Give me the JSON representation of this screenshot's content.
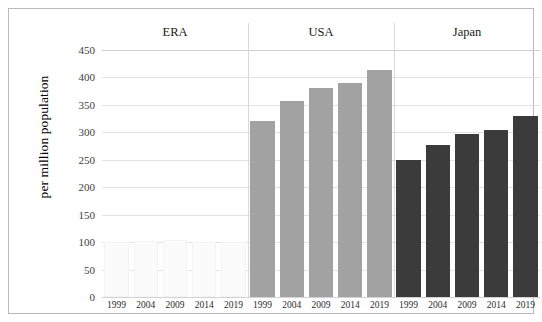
{
  "chart_data": {
    "type": "bar",
    "title": "",
    "xlabel": "",
    "ylabel": "per million population",
    "ylim": [
      0,
      450
    ],
    "ytick_step": 50,
    "yticks": [
      450,
      400,
      350,
      300,
      250,
      200,
      150,
      100,
      50,
      0
    ],
    "grid": true,
    "legend": "none",
    "group_labels": [
      "ERA",
      "USA",
      "Japan"
    ],
    "categories": [
      "1999",
      "2004",
      "2009",
      "2014",
      "2019"
    ],
    "series": [
      {
        "name": "ERA",
        "color": "#fbfbfb",
        "categories": [
          "1999",
          "2004",
          "2009",
          "2014",
          "2019"
        ],
        "values": [
          100,
          102,
          103,
          101,
          100
        ]
      },
      {
        "name": "USA",
        "color": "#a2a2a2",
        "categories": [
          "1999",
          "2004",
          "2009",
          "2014",
          "2019"
        ],
        "values": [
          320,
          358,
          380,
          390,
          413
        ]
      },
      {
        "name": "Japan",
        "color": "#3b3b3b",
        "categories": [
          "1999",
          "2004",
          "2009",
          "2014",
          "2019"
        ],
        "values": [
          250,
          277,
          297,
          305,
          330
        ]
      }
    ]
  },
  "axis": {
    "y_title": "per million population",
    "y_tick_labels": [
      "450",
      "400",
      "350",
      "300",
      "250",
      "200",
      "150",
      "100",
      "50",
      "0"
    ],
    "x_tick_labels": [
      "1999",
      "2004",
      "2009",
      "2014",
      "2019",
      "1999",
      "2004",
      "2009",
      "2014",
      "2019",
      "1999",
      "2004",
      "2009",
      "2014",
      "2019"
    ]
  },
  "groups": [
    {
      "label": "ERA"
    },
    {
      "label": "USA"
    },
    {
      "label": "Japan"
    }
  ],
  "colors": {
    "era_bar": "#fbfbfb",
    "usa_bar": "#a2a2a2",
    "japan_bar": "#3b3b3b",
    "gridline": "#e2e2e2",
    "frame": "#b9b9b9",
    "background": "#ffffff"
  }
}
